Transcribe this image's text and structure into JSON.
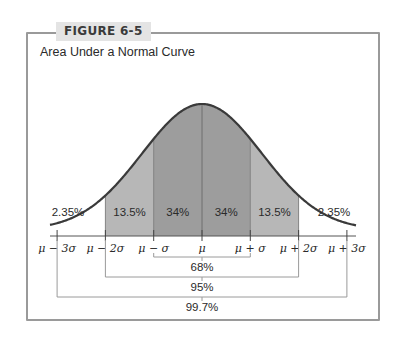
{
  "figure": {
    "label": "FIGURE 6-5",
    "title": "Area Under a Normal Curve"
  },
  "chart_data": {
    "type": "area",
    "title": "Area Under a Normal Curve",
    "figure_label": "FIGURE 6-5",
    "distribution": "normal",
    "x_tick_labels": [
      "μ − 3σ",
      "μ − 2σ",
      "μ − σ",
      "μ",
      "μ + σ",
      "μ + 2σ",
      "μ + 3σ"
    ],
    "x_ticks_sigma": [
      -3,
      -2,
      -1,
      0,
      1,
      2,
      3
    ],
    "regions": [
      {
        "from": -3,
        "to": -2,
        "label": "2.35%",
        "value": 2.35,
        "shaded": false
      },
      {
        "from": -2,
        "to": -1,
        "label": "13.5%",
        "value": 13.5,
        "shaded": true,
        "shade": "light"
      },
      {
        "from": -1,
        "to": 0,
        "label": "34%",
        "value": 34,
        "shaded": true,
        "shade": "dark"
      },
      {
        "from": 0,
        "to": 1,
        "label": "34%",
        "value": 34,
        "shaded": true,
        "shade": "dark"
      },
      {
        "from": 1,
        "to": 2,
        "label": "13.5%",
        "value": 13.5,
        "shaded": true,
        "shade": "light"
      },
      {
        "from": 2,
        "to": 3,
        "label": "2.35%",
        "value": 2.35,
        "shaded": false
      }
    ],
    "brackets": [
      {
        "from": -1,
        "to": 1,
        "label": "68%",
        "value": 68
      },
      {
        "from": -2,
        "to": 2,
        "label": "95%",
        "value": 95
      },
      {
        "from": -3,
        "to": 3,
        "label": "99.7%",
        "value": 99.7
      }
    ],
    "colors": {
      "dark_shade": "#9d9d9d",
      "light_shade": "#b7b7b7",
      "curve": "#3a3a3a",
      "bracket": "#9a9a9a"
    },
    "grid": false,
    "legend": false
  }
}
